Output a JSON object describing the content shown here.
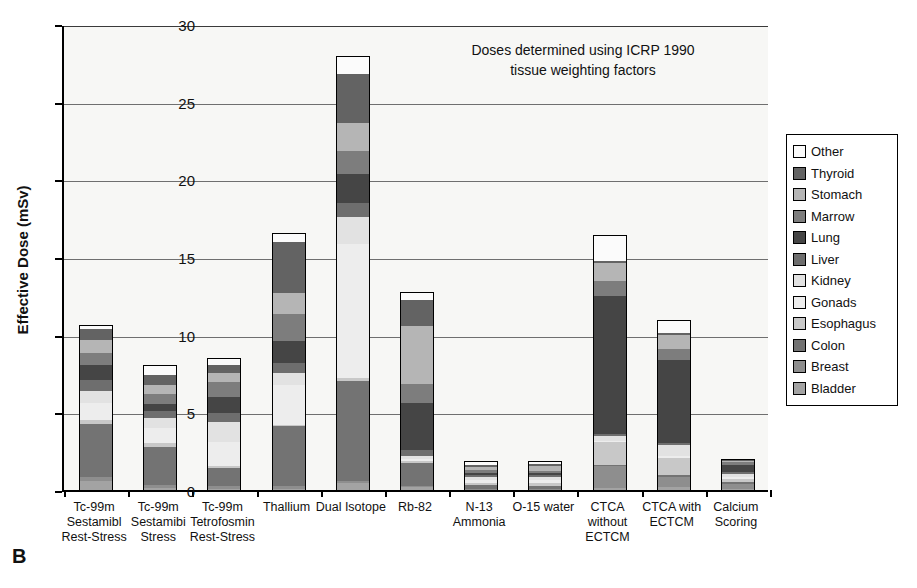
{
  "panel_label": "B",
  "annotation": "Doses determined using ICRP 1990\ntissue weighting factors",
  "axes": {
    "ylabel": "Effective Dose (mSv)",
    "yticks": [
      "0",
      "5",
      "10",
      "15",
      "20",
      "25",
      "30"
    ],
    "ymin": 0,
    "ymax": 30
  },
  "legend": {
    "items": [
      {
        "label": "Other",
        "color": "#fbfbfb"
      },
      {
        "label": "Thyroid",
        "color": "#636363"
      },
      {
        "label": "Stomach",
        "color": "#b5b5b5"
      },
      {
        "label": "Marrow",
        "color": "#7d7d7d"
      },
      {
        "label": "Lung",
        "color": "#454545"
      },
      {
        "label": "Liver",
        "color": "#6e6e6e"
      },
      {
        "label": "Kidney",
        "color": "#e2e2e2"
      },
      {
        "label": "Gonads",
        "color": "#ededed"
      },
      {
        "label": "Esophagus",
        "color": "#c8c8c8"
      },
      {
        "label": "Colon",
        "color": "#737373"
      },
      {
        "label": "Breast",
        "color": "#8e8e8e"
      },
      {
        "label": "Bladder",
        "color": "#a3a3a3"
      }
    ]
  },
  "chart_data": {
    "type": "bar",
    "subtype": "stacked-vertical",
    "title": "",
    "xlabel": "",
    "ylabel": "Effective Dose (mSv)",
    "ylim": [
      0,
      30
    ],
    "grid": true,
    "legend_position": "right-outside",
    "annotation": "Doses determined using ICRP 1990 tissue weighting factors",
    "categories": [
      "Tc-99m\nSestamibl\nRest-Stress",
      "Tc-99m\nSestamibi\nStress",
      "Tc-99m\nTetrofosmin\nRest-Stress",
      "Thallium",
      "Dual Isotope",
      "Rb-82",
      "N-13\nAmmonia",
      "O-15 water",
      "CTCA\nwithout\nECTCM",
      "CTCA with\nECTCM",
      "Calcium\nScoring"
    ],
    "series_order_bottom_to_top": [
      "Bladder",
      "Breast",
      "Colon",
      "Esophagus",
      "Gonads",
      "Kidney",
      "Liver",
      "Lung",
      "Marrow",
      "Stomach",
      "Thyroid",
      "Other"
    ],
    "series": [
      {
        "name": "Bladder",
        "values": [
          0.7,
          0.25,
          0.2,
          0.2,
          0.55,
          0.3,
          0.1,
          0.1,
          0.25,
          0.3,
          0.2
        ]
      },
      {
        "name": "Breast",
        "values": [
          0.3,
          0.25,
          0.25,
          0.25,
          0.2,
          0.15,
          0.15,
          0.15,
          1.5,
          0.75,
          0.35
        ]
      },
      {
        "name": "Colon",
        "values": [
          3.5,
          2.55,
          1.25,
          3.95,
          6.55,
          1.55,
          0.3,
          0.25,
          0.15,
          0.15,
          0.25
        ]
      },
      {
        "name": "Esophagus",
        "values": [
          0.3,
          0.3,
          0.15,
          0.1,
          0.25,
          0.2,
          0.2,
          0.25,
          1.5,
          1.2,
          0.25
        ]
      },
      {
        "name": "Gonads",
        "values": [
          1.2,
          1.05,
          1.65,
          2.65,
          8.7,
          0.2,
          0.25,
          0.25,
          0.15,
          0.15,
          0.2
        ]
      },
      {
        "name": "Kidney",
        "values": [
          0.85,
          0.7,
          1.35,
          0.85,
          1.75,
          0.25,
          0.25,
          0.25,
          0.35,
          0.8,
          0.25
        ]
      },
      {
        "name": "Liver",
        "values": [
          0.75,
          0.5,
          0.65,
          0.7,
          1.0,
          0.45,
          0.2,
          0.2,
          0.2,
          0.2,
          0.2
        ]
      },
      {
        "name": "Lung",
        "values": [
          1.05,
          0.55,
          1.05,
          1.45,
          1.9,
          3.1,
          0.2,
          0.2,
          9.0,
          5.4,
          0.5
        ]
      },
      {
        "name": "Marrow",
        "values": [
          0.8,
          0.65,
          1.05,
          1.8,
          1.6,
          1.25,
          0.25,
          0.2,
          1.0,
          0.8,
          0.25
        ]
      },
      {
        "name": "Stomach",
        "values": [
          0.9,
          0.65,
          0.65,
          1.45,
          1.85,
          3.8,
          0.25,
          0.35,
          1.2,
          0.95,
          0.15
        ]
      },
      {
        "name": "Thyroid",
        "values": [
          0.8,
          0.75,
          0.55,
          3.35,
          3.2,
          1.75,
          0.2,
          0.2,
          0.2,
          0.2,
          0.1
        ]
      },
      {
        "name": "Other",
        "values": [
          0.25,
          0.65,
          0.45,
          0.55,
          1.15,
          0.55,
          0.25,
          0.25,
          1.7,
          0.8,
          0.05
        ]
      }
    ],
    "totals": [
      11.4,
      8.0,
      9.3,
      22.0,
      29.2,
      13.5,
      2.4,
      2.4,
      17.2,
      11.5,
      2.5
    ]
  }
}
